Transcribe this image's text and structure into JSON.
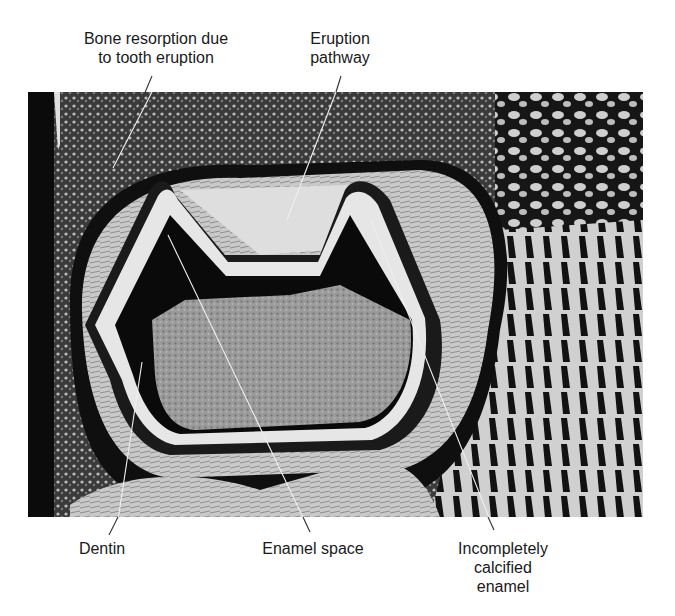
{
  "figure": {
    "type": "histology micrograph",
    "colors": {
      "background": "#ffffff",
      "tissue_dark": "#0d0d0d",
      "tissue_mid": "#8a8a8a",
      "tissue_light": "#d9d9d9",
      "label_text": "#1a1a1a",
      "leader_line": "#e8e8e8"
    }
  },
  "labels": {
    "bone_resorption": {
      "line1": "Bone resorption due",
      "line2": "to tooth eruption"
    },
    "eruption_pathway": {
      "line1": "Eruption",
      "line2": "pathway"
    },
    "dentin": {
      "text": "Dentin"
    },
    "enamel_space": {
      "text": "Enamel space"
    },
    "incompletely_calcified_enamel": {
      "line1": "Incompletely",
      "line2": "calcified",
      "line3": "enamel"
    }
  }
}
